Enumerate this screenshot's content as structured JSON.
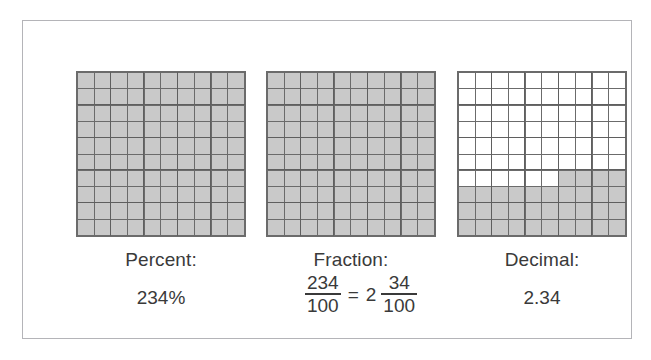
{
  "figure": {
    "border_color": "#b4b4b8",
    "shade_color": "#c9c9c9",
    "gridline_color": "#6b6b6b",
    "text_color": "#3a3a3a"
  },
  "panels": [
    {
      "id": "percent",
      "label": "Percent:",
      "value": "234%",
      "grid": {
        "rows": 10,
        "cols": 10,
        "shaded_count": 100,
        "shaded_description": "all cells shaded"
      }
    },
    {
      "id": "fraction",
      "label": "Fraction:",
      "value": "234/100 = 2 34/100",
      "fraction": {
        "improper_numerator": "234",
        "improper_denominator": "100",
        "equals": "=",
        "whole": "2",
        "mixed_numerator": "34",
        "mixed_denominator": "100"
      },
      "grid": {
        "rows": 10,
        "cols": 10,
        "shaded_count": 100,
        "shaded_description": "all cells shaded"
      }
    },
    {
      "id": "decimal",
      "label": "Decimal:",
      "value": "2.34",
      "grid": {
        "rows": 10,
        "cols": 10,
        "shaded_count": 34,
        "shaded_description": "bottom three rows fully shaded plus four right-hand cells in row seven",
        "shaded_cells": [
          [
            7,
            7
          ],
          [
            7,
            8
          ],
          [
            7,
            9
          ],
          [
            7,
            10
          ],
          [
            8,
            1
          ],
          [
            8,
            2
          ],
          [
            8,
            3
          ],
          [
            8,
            4
          ],
          [
            8,
            5
          ],
          [
            8,
            6
          ],
          [
            8,
            7
          ],
          [
            8,
            8
          ],
          [
            8,
            9
          ],
          [
            8,
            10
          ],
          [
            9,
            1
          ],
          [
            9,
            2
          ],
          [
            9,
            3
          ],
          [
            9,
            4
          ],
          [
            9,
            5
          ],
          [
            9,
            6
          ],
          [
            9,
            7
          ],
          [
            9,
            8
          ],
          [
            9,
            9
          ],
          [
            9,
            10
          ],
          [
            10,
            1
          ],
          [
            10,
            2
          ],
          [
            10,
            3
          ],
          [
            10,
            4
          ],
          [
            10,
            5
          ],
          [
            10,
            6
          ],
          [
            10,
            7
          ],
          [
            10,
            8
          ],
          [
            10,
            9
          ],
          [
            10,
            10
          ]
        ]
      }
    }
  ]
}
